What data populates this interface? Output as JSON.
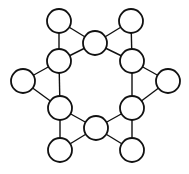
{
  "diagram": {
    "type": "undirected-graph",
    "node_radius": 12,
    "colors": {
      "stroke": "#111111",
      "fill": "#ffffff",
      "background": "#ffffff"
    },
    "nodes": [
      {
        "id": "n1",
        "x": 59,
        "y": 21
      },
      {
        "id": "n2",
        "x": 131,
        "y": 21
      },
      {
        "id": "n3",
        "x": 95,
        "y": 43
      },
      {
        "id": "n4",
        "x": 59,
        "y": 61
      },
      {
        "id": "n5",
        "x": 132,
        "y": 61
      },
      {
        "id": "n6",
        "x": 23,
        "y": 81
      },
      {
        "id": "n7",
        "x": 168,
        "y": 81
      },
      {
        "id": "n8",
        "x": 60,
        "y": 108
      },
      {
        "id": "n9",
        "x": 132,
        "y": 108
      },
      {
        "id": "n10",
        "x": 96,
        "y": 128
      },
      {
        "id": "n11",
        "x": 60,
        "y": 150
      },
      {
        "id": "n12",
        "x": 132,
        "y": 150
      }
    ],
    "edges": [
      [
        "n1",
        "n4"
      ],
      [
        "n1",
        "n3"
      ],
      [
        "n3",
        "n4"
      ],
      [
        "n2",
        "n3"
      ],
      [
        "n2",
        "n5"
      ],
      [
        "n3",
        "n5"
      ],
      [
        "n4",
        "n6"
      ],
      [
        "n4",
        "n8"
      ],
      [
        "n6",
        "n8"
      ],
      [
        "n5",
        "n7"
      ],
      [
        "n5",
        "n9"
      ],
      [
        "n7",
        "n9"
      ],
      [
        "n8",
        "n10"
      ],
      [
        "n8",
        "n11"
      ],
      [
        "n11",
        "n10"
      ],
      [
        "n9",
        "n10"
      ],
      [
        "n9",
        "n12"
      ],
      [
        "n12",
        "n10"
      ]
    ]
  }
}
